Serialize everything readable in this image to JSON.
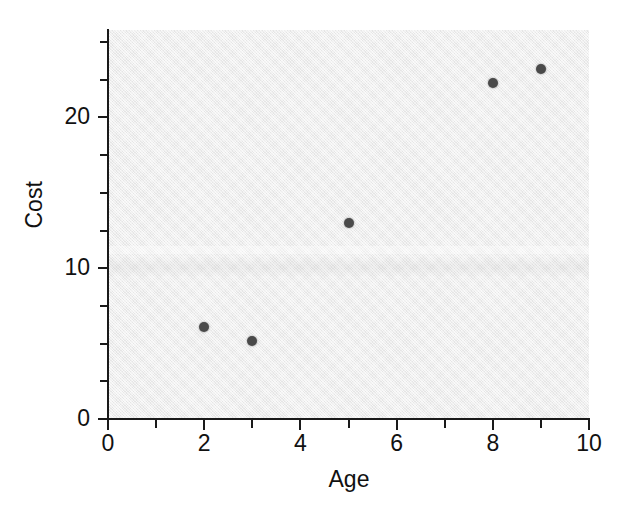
{
  "chart_data": {
    "type": "scatter",
    "title": "",
    "xlabel": "Age",
    "ylabel": "Cost",
    "xlim": [
      0,
      10
    ],
    "ylim": [
      0,
      25.8
    ],
    "grid": false,
    "legend": null,
    "x": [
      2,
      3,
      5,
      8,
      9
    ],
    "y": [
      6.1,
      5.2,
      13.0,
      22.3,
      23.2
    ],
    "points": [
      {
        "x": 2,
        "y": 6.1
      },
      {
        "x": 3,
        "y": 5.2
      },
      {
        "x": 5,
        "y": 13.0
      },
      {
        "x": 8,
        "y": 22.3
      },
      {
        "x": 9,
        "y": 23.2
      }
    ],
    "marker": {
      "shape": "circle",
      "color": "#4a4a4a",
      "size": 10
    },
    "x_ticks_major": [
      0,
      2,
      4,
      6,
      8,
      10
    ],
    "x_ticks_minor": [
      1,
      3,
      5,
      7,
      9
    ],
    "x_tick_labels": [
      "0",
      "2",
      "4",
      "6",
      "8",
      "10"
    ],
    "y_ticks_major": [
      0,
      10,
      20
    ],
    "y_ticks_minor": [
      2.5,
      5,
      7.5,
      12.5,
      15,
      17.5,
      22.5,
      25
    ],
    "y_tick_labels": [
      "0",
      "10",
      "20"
    ],
    "plot_background": "#ececec",
    "axis_color": "#1a1a1a",
    "text_color": "#111111"
  }
}
